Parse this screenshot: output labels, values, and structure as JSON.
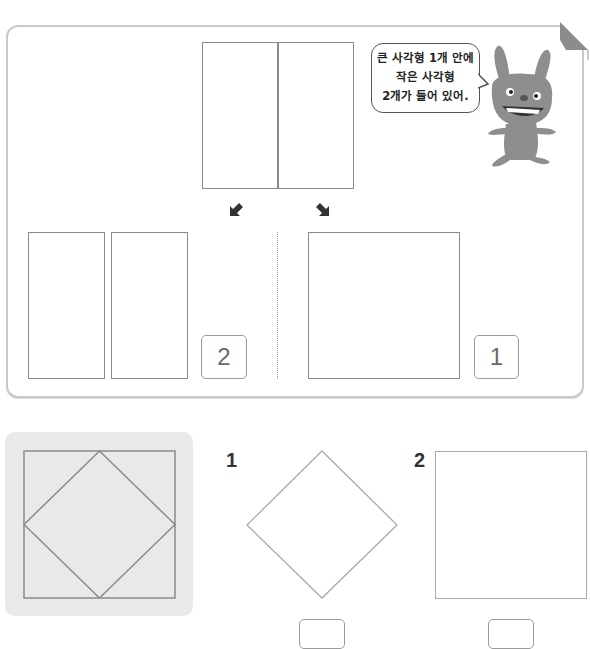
{
  "example": {
    "bubble_lines": [
      "큰 사각형 1개 안에",
      "작은 사각형",
      "2개가 들어 있어."
    ],
    "arrows": [
      "down-left-arrow",
      "down-right-arrow"
    ],
    "left_result": {
      "description": "two small rectangles",
      "count": "2"
    },
    "right_result": {
      "description": "one large square",
      "count": "1"
    }
  },
  "problems": [
    {
      "number": "1",
      "shape": "diamond",
      "answer": ""
    },
    {
      "number": "2",
      "shape": "square",
      "answer": ""
    }
  ],
  "reference_figure": {
    "description": "square with inscribed diamond"
  },
  "colors": {
    "panel_border": "#c9c9c9",
    "shape_stroke": "#8a8a8a",
    "card_bg": "#e9e9e9",
    "fold": "#8c8c8c"
  }
}
